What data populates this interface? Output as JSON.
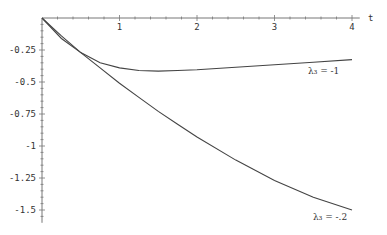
{
  "chart_data": {
    "type": "line",
    "title": "",
    "xlabel": "t",
    "ylabel": "",
    "xlim": [
      0,
      4
    ],
    "ylim": [
      -1.6,
      0
    ],
    "grid": false,
    "legend_position": "inline labels at curve ends",
    "x_ticks": [
      "1",
      "2",
      "3",
      "4"
    ],
    "y_ticks": [
      "-0.25",
      "-0.5",
      "-0.75",
      "-1",
      "-1.25",
      "-1.5"
    ],
    "x": [
      0,
      0.25,
      0.5,
      0.75,
      1,
      1.25,
      1.5,
      1.75,
      2,
      2.5,
      3,
      3.5,
      4
    ],
    "series": [
      {
        "name": "λ3 = -1",
        "label": "λ₃ = -1",
        "values": [
          0,
          -0.16,
          -0.27,
          -0.35,
          -0.39,
          -0.41,
          -0.415,
          -0.41,
          -0.405,
          -0.385,
          -0.365,
          -0.345,
          -0.325
        ]
      },
      {
        "name": "λ3 = -.2",
        "label": "λ₃ = -.2",
        "values": [
          0,
          -0.14,
          -0.27,
          -0.39,
          -0.51,
          -0.62,
          -0.73,
          -0.83,
          -0.93,
          -1.11,
          -1.27,
          -1.4,
          -1.5
        ]
      }
    ]
  }
}
